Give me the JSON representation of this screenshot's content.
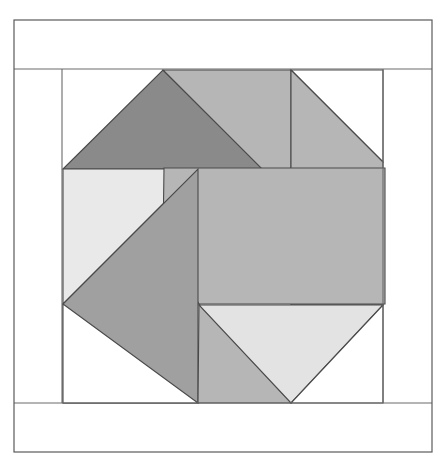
{
  "document": {
    "kind": "quilt-block-diagram",
    "title": "Pinwheel Quilt Block",
    "background_color": "#ffffff"
  },
  "canvas": {
    "width": 445,
    "height": 466
  },
  "palette": {
    "background": "#ffffff",
    "outline": "#4a4a4a",
    "frame_outline": "#5a5a5a",
    "white_patch": "#ffffff",
    "very_light_gray": "#e9e9e9",
    "light_gray": "#d9d9d9",
    "medium_gray": "#b6b6b6",
    "medium_dark_gray": "#a0a0a0",
    "dark_gray": "#8a8a8a"
  },
  "frame": {
    "outer": {
      "x": 14,
      "y": 20,
      "width": 418,
      "height": 432
    },
    "top_sash": {
      "x": 14,
      "y": 20,
      "width": 418,
      "height": 49,
      "fill": "#ffffff"
    },
    "bottom_sash": {
      "x": 14,
      "y": 403,
      "width": 418,
      "height": 49,
      "fill": "#ffffff"
    },
    "left_sash": {
      "x": 14,
      "y": 69,
      "width": 48,
      "height": 334,
      "fill": "#ffffff"
    },
    "right_sash": {
      "x": 383,
      "y": 69,
      "width": 49,
      "height": 334,
      "fill": "#ffffff"
    },
    "inner_block": {
      "x": 62,
      "y": 69,
      "width": 321,
      "height": 334
    }
  },
  "block": {
    "name": "pinwheel-with-octagon-center",
    "center_octagon": {
      "fill": "#b6b6b6",
      "points": "164,170 281,170 385,170 385,303 281,303 200,303 164,240 164,170"
    },
    "patches": [
      {
        "id": "patch-top-left-dark-triangle",
        "label": "Top left dark triangle",
        "fill": "#8a8a8a",
        "points": "63,169 163,70 263,169"
      },
      {
        "id": "patch-top-medium-triangle",
        "label": "Top medium gray triangle",
        "fill": "#b6b6b6",
        "points": "163,70 291,70 291,198"
      },
      {
        "id": "patch-top-right-background",
        "label": "Top right white background",
        "fill": "#ffffff",
        "points": "291,70 383,70 383,162"
      },
      {
        "id": "patch-right-medium-triangle",
        "label": "Right medium gray triangle",
        "fill": "#b6b6b6",
        "points": "291,70 383,162 383,305 291,305"
      },
      {
        "id": "patch-upper-left-light",
        "label": "Upper left very light triangle",
        "fill": "#e9e9e9",
        "points": "63,169 198,169 63,304"
      },
      {
        "id": "patch-center-octagon",
        "label": "Center octagon",
        "fill": "#b6b6b6",
        "points": "164,168 289,168 385,168 385,304 291,304 199,304 163,241"
      },
      {
        "id": "patch-lower-left-dark",
        "label": "Lower left medium dark triangle",
        "fill": "#a0a0a0",
        "points": "198,169 198,403 63,403 63,304"
      },
      {
        "id": "patch-bottom-left-background",
        "label": "Bottom left white background",
        "fill": "#ffffff",
        "points": "63,304 198,403 63,403"
      },
      {
        "id": "patch-bottom-medium-triangle",
        "label": "Bottom medium gray triangle",
        "fill": "#b6b6b6",
        "points": "199,304 291,403 198,403"
      },
      {
        "id": "patch-bottom-right-light",
        "label": "Bottom right light triangle",
        "fill": "#e3e3e3",
        "points": "199,305 383,305 291,403"
      },
      {
        "id": "patch-bottom-right-background",
        "label": "Bottom right white background",
        "fill": "#ffffff",
        "points": "383,305 383,403 291,403"
      }
    ],
    "guide_lines": [
      {
        "id": "line-left-sash",
        "x1": 62,
        "y1": 69,
        "x2": 62,
        "y2": 403
      },
      {
        "id": "line-right-sash",
        "x1": 383,
        "y1": 69,
        "x2": 383,
        "y2": 403
      },
      {
        "id": "line-top-sash",
        "x1": 14,
        "y1": 69,
        "x2": 432,
        "y2": 69
      },
      {
        "id": "line-bottom-sash",
        "x1": 14,
        "y1": 403,
        "x2": 432,
        "y2": 403
      }
    ]
  }
}
